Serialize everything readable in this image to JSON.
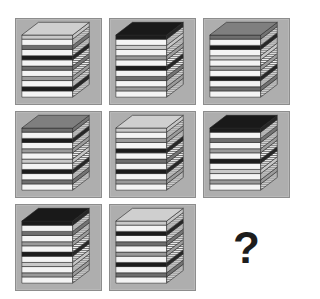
{
  "puzzle": {
    "type": "matrix-reasoning",
    "subject": "stacks of books",
    "rows": 3,
    "columns": 3,
    "background_color": "#ffffff",
    "panel_color": "#aeaeae",
    "panel_border_color": "#8d8d8d",
    "missing_cell_label": "?",
    "missing_cell_index": 8
  },
  "palette": {
    "black_cover": "#1c1c1c",
    "dark_gray_cover": "#6e6e6e",
    "light_gray_cover": "#c9c9c9",
    "mid_gray_cover": "#9a9a9a",
    "page_edge_light": "#f2f2f2",
    "page_edge_line": "#4a4a4a",
    "outline": "#2b2b2b"
  },
  "legend": {
    "K": "black_cover",
    "D": "dark_gray_cover",
    "L": "light_gray_cover",
    "M": "mid_gray_cover"
  },
  "cells": [
    {
      "index": 0,
      "position": "row1-col1",
      "name": "stack-r1c1",
      "book_count": 6,
      "covers_top_to_bottom": [
        "L",
        "D",
        "K",
        "D",
        "M",
        "K"
      ],
      "has_question_mark": false
    },
    {
      "index": 1,
      "position": "row1-col2",
      "name": "stack-r1c2",
      "book_count": 6,
      "covers_top_to_bottom": [
        "K",
        "L",
        "M",
        "K",
        "D",
        "M"
      ],
      "has_question_mark": false
    },
    {
      "index": 2,
      "position": "row1-col3",
      "name": "stack-r1c3",
      "book_count": 6,
      "covers_top_to_bottom": [
        "D",
        "K",
        "L",
        "M",
        "K",
        "D"
      ],
      "has_question_mark": false
    },
    {
      "index": 3,
      "position": "row2-col1",
      "name": "stack-r2c1",
      "book_count": 6,
      "covers_top_to_bottom": [
        "D",
        "K",
        "M",
        "L",
        "K",
        "D"
      ],
      "has_question_mark": false
    },
    {
      "index": 4,
      "position": "row2-col2",
      "name": "stack-r2c2",
      "book_count": 6,
      "covers_top_to_bottom": [
        "L",
        "M",
        "K",
        "D",
        "K",
        "M"
      ],
      "has_question_mark": false
    },
    {
      "index": 5,
      "position": "row2-col3",
      "name": "stack-r2c3",
      "book_count": 6,
      "covers_top_to_bottom": [
        "K",
        "D",
        "M",
        "K",
        "L",
        "M"
      ],
      "has_question_mark": false
    },
    {
      "index": 6,
      "position": "row3-col1",
      "name": "stack-r3c1",
      "book_count": 6,
      "covers_top_to_bottom": [
        "K",
        "D",
        "M",
        "K",
        "L",
        "M"
      ],
      "has_question_mark": false
    },
    {
      "index": 7,
      "position": "row3-col2",
      "name": "stack-r3c2",
      "book_count": 6,
      "covers_top_to_bottom": [
        "L",
        "K",
        "D",
        "M",
        "K",
        "D"
      ],
      "has_question_mark": false
    },
    {
      "index": 8,
      "position": "row3-col3",
      "name": "answer-placeholder",
      "book_count": 0,
      "covers_top_to_bottom": [],
      "has_question_mark": true
    }
  ]
}
